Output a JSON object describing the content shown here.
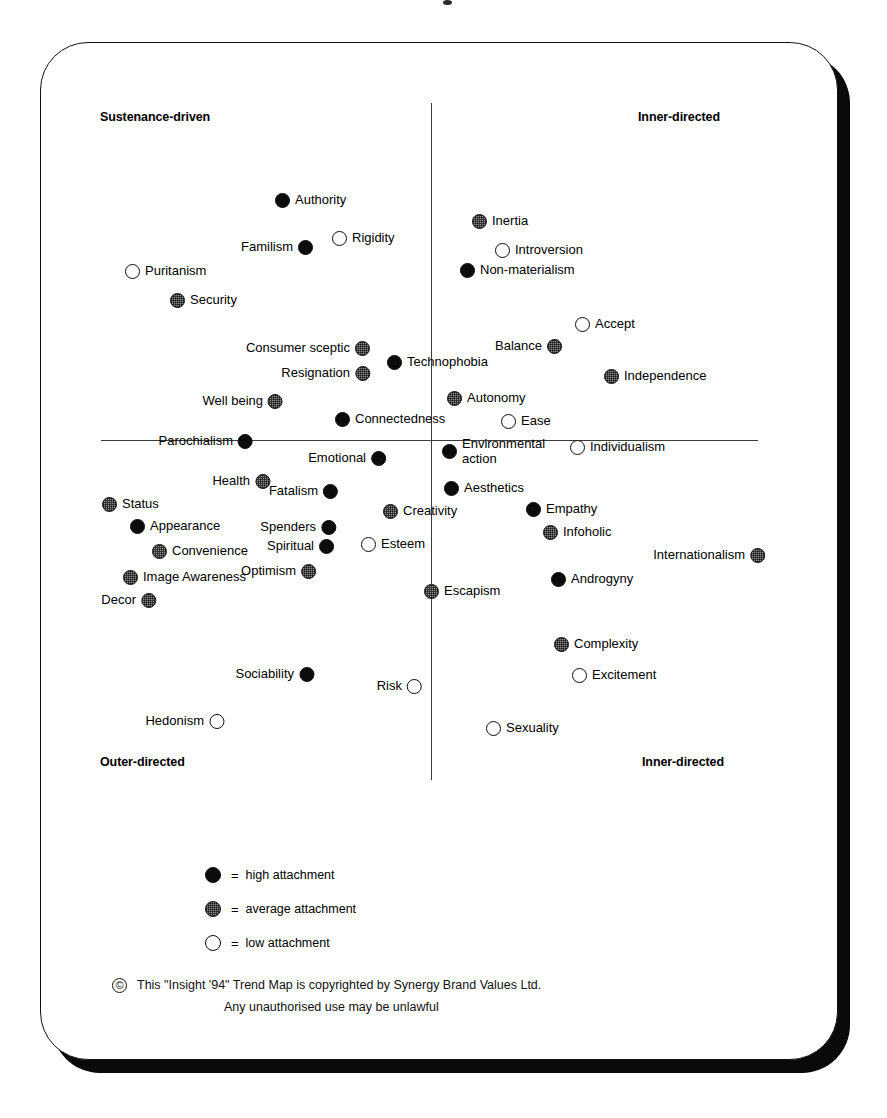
{
  "axes": {
    "quadrant_labels": {
      "top_left": "Sustenance-driven",
      "top_right": "Inner-directed",
      "bottom_left": "Outer-directed",
      "bottom_right": "Inner-directed"
    }
  },
  "legend": {
    "equals": "=",
    "items": [
      {
        "level": "high",
        "label": "high attachment"
      },
      {
        "level": "average",
        "label": "average attachment"
      },
      {
        "level": "low",
        "label": "low attachment"
      }
    ]
  },
  "copyright": {
    "symbol": "©",
    "line1": "This \"Insight '94\" Trend Map is copyrighted by Synergy Brand Values Ltd.",
    "line2": "Any unauthorised use may be unlawful"
  },
  "chart_data": {
    "type": "scatter",
    "xlabel": "Outer-directed  ↔  Inner-directed",
    "ylabel": "Sustenance-driven  ↔  Outer/Inner-directed",
    "grid": false,
    "legend_position": "bottom-left",
    "axis_origin_px": {
      "x": 431,
      "y": 440
    },
    "categories": [
      "high attachment",
      "average attachment",
      "low attachment"
    ],
    "points": [
      {
        "label": "Authority",
        "level": "high",
        "x": 283,
        "y": 201,
        "side": "right"
      },
      {
        "label": "Rigidity",
        "level": "low",
        "x": 340,
        "y": 239,
        "side": "right"
      },
      {
        "label": "Familism",
        "level": "high",
        "x": 305,
        "y": 248,
        "side": "left"
      },
      {
        "label": "Puritanism",
        "level": "low",
        "x": 133,
        "y": 272,
        "side": "right"
      },
      {
        "label": "Security",
        "level": "average",
        "x": 178,
        "y": 301,
        "side": "right"
      },
      {
        "label": "Consumer sceptic",
        "level": "average",
        "x": 362,
        "y": 349,
        "side": "left"
      },
      {
        "label": "Technophobia",
        "level": "high",
        "x": 395,
        "y": 363,
        "side": "right"
      },
      {
        "label": "Resignation",
        "level": "average",
        "x": 362,
        "y": 374,
        "side": "left"
      },
      {
        "label": "Well being",
        "level": "average",
        "x": 275,
        "y": 402,
        "side": "left"
      },
      {
        "label": "Connectedness",
        "level": "high",
        "x": 343,
        "y": 420,
        "side": "right"
      },
      {
        "label": "Parochialism",
        "level": "high",
        "x": 245,
        "y": 442,
        "side": "left"
      },
      {
        "label": "Emotional",
        "level": "high",
        "x": 378,
        "y": 459,
        "side": "left"
      },
      {
        "label": "Health",
        "level": "average",
        "x": 262,
        "y": 482,
        "side": "left"
      },
      {
        "label": "Fatalism",
        "level": "high",
        "x": 330,
        "y": 492,
        "side": "left"
      },
      {
        "label": "Status",
        "level": "average",
        "x": 110,
        "y": 505,
        "side": "right"
      },
      {
        "label": "Creativity",
        "level": "average",
        "x": 391,
        "y": 512,
        "side": "right"
      },
      {
        "label": "Appearance",
        "level": "high",
        "x": 138,
        "y": 527,
        "side": "right"
      },
      {
        "label": "Spenders",
        "level": "high",
        "x": 328,
        "y": 528,
        "side": "left"
      },
      {
        "label": "Convenience",
        "level": "average",
        "x": 160,
        "y": 552,
        "side": "right"
      },
      {
        "label": "Spiritual",
        "level": "high",
        "x": 326,
        "y": 547,
        "side": "left"
      },
      {
        "label": "Esteem",
        "level": "low",
        "x": 369,
        "y": 545,
        "side": "right"
      },
      {
        "label": "Optimism",
        "level": "average",
        "x": 308,
        "y": 572,
        "side": "left"
      },
      {
        "label": "Image Awareness",
        "level": "average",
        "x": 131,
        "y": 578,
        "side": "right"
      },
      {
        "label": "Escapism",
        "level": "average",
        "x": 432,
        "y": 592,
        "side": "right"
      },
      {
        "label": "Decor",
        "level": "average",
        "x": 148,
        "y": 601,
        "side": "left"
      },
      {
        "label": "Sociability",
        "level": "high",
        "x": 306,
        "y": 675,
        "side": "left"
      },
      {
        "label": "Risk",
        "level": "low",
        "x": 414,
        "y": 687,
        "side": "left"
      },
      {
        "label": "Hedonism",
        "level": "low",
        "x": 216,
        "y": 722,
        "side": "left"
      },
      {
        "label": "Inertia",
        "level": "average",
        "x": 480,
        "y": 222,
        "side": "right"
      },
      {
        "label": "Introversion",
        "level": "low",
        "x": 503,
        "y": 251,
        "side": "right"
      },
      {
        "label": "Non-materialism",
        "level": "high",
        "x": 468,
        "y": 271,
        "side": "right"
      },
      {
        "label": "Accept",
        "level": "low",
        "x": 583,
        "y": 325,
        "side": "right"
      },
      {
        "label": "Balance",
        "level": "average",
        "x": 554,
        "y": 347,
        "side": "left"
      },
      {
        "label": "Independence",
        "level": "average",
        "x": 612,
        "y": 377,
        "side": "right"
      },
      {
        "label": "Autonomy",
        "level": "average",
        "x": 455,
        "y": 399,
        "side": "right"
      },
      {
        "label": "Ease",
        "level": "low",
        "x": 509,
        "y": 422,
        "side": "right"
      },
      {
        "label": "Environmental action",
        "level": "high",
        "x": 450,
        "y": 445,
        "side": "right",
        "wrap": true
      },
      {
        "label": "Individualism",
        "level": "low",
        "x": 578,
        "y": 448,
        "side": "right"
      },
      {
        "label": "Aesthetics",
        "level": "high",
        "x": 452,
        "y": 489,
        "side": "right"
      },
      {
        "label": "Empathy",
        "level": "high",
        "x": 534,
        "y": 510,
        "side": "right"
      },
      {
        "label": "Infoholic",
        "level": "average",
        "x": 551,
        "y": 533,
        "side": "right"
      },
      {
        "label": "Internationalism",
        "level": "average",
        "x": 757,
        "y": 556,
        "side": "left"
      },
      {
        "label": "Androgyny",
        "level": "high",
        "x": 559,
        "y": 580,
        "side": "right"
      },
      {
        "label": "Complexity",
        "level": "average",
        "x": 562,
        "y": 645,
        "side": "right"
      },
      {
        "label": "Excitement",
        "level": "low",
        "x": 580,
        "y": 676,
        "side": "right"
      },
      {
        "label": "Sexuality",
        "level": "low",
        "x": 494,
        "y": 729,
        "side": "right"
      }
    ]
  }
}
